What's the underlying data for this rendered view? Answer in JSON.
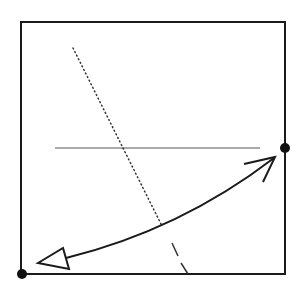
{
  "diagram": {
    "colors": {
      "background": "#ffffff",
      "stroke": "#1a1a1a",
      "thin_stroke": "#444444"
    },
    "frame": {
      "x": 21,
      "y": 22,
      "width": 264,
      "height": 252
    },
    "dots": [
      {
        "name": "bottom-left-dot",
        "cx": 22,
        "cy": 274,
        "r": 5
      },
      {
        "name": "right-edge-dot",
        "cx": 285,
        "cy": 148,
        "r": 5
      }
    ],
    "horizontal_line": {
      "x1": 55,
      "y1": 148,
      "x2": 260,
      "y2": 148
    },
    "dotted_line": {
      "x1": 73,
      "y1": 48,
      "x2": 162,
      "y2": 226
    },
    "dashed_segments": [
      {
        "x1": 172,
        "y1": 243,
        "x2": 178,
        "y2": 256
      },
      {
        "x1": 181,
        "y1": 263,
        "x2": 188,
        "y2": 274
      }
    ],
    "curved_arrow": {
      "path": "M 66 258 Q 180 230 274 158",
      "open_head": {
        "tip": [
          275,
          157
        ],
        "barb1": [
          244,
          164
        ],
        "barb2": [
          263,
          182
        ]
      },
      "hollow_head": {
        "tip": [
          38,
          263
        ],
        "corner1": [
          63,
          248
        ],
        "corner2": [
          69,
          269
        ]
      }
    }
  }
}
